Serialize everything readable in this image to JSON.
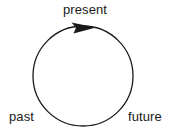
{
  "diagram": {
    "background_color": "#ffffff",
    "stroke_color": "#1a1a1a",
    "labels": {
      "top": "present",
      "bottom_left": "past",
      "bottom_right": "future"
    },
    "circle": {
      "center_x": 83,
      "center_y": 76,
      "radius": 50,
      "stroke_width": 1.3,
      "fill": "none"
    },
    "arrow": {
      "name": "clockwise-arrowhead",
      "direction": "clockwise",
      "position": "top",
      "tip_x": 96,
      "tip_y": 27,
      "fill": "#1a1a1a"
    }
  }
}
